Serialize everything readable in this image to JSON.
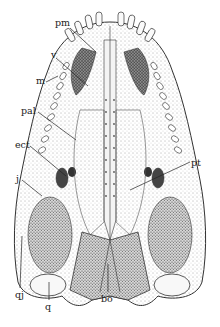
{
  "figure": {
    "background": "#ffffff",
    "ink": "#222222",
    "labels": [
      {
        "id": "pm",
        "text": "pm",
        "x": 55,
        "y": 18
      },
      {
        "id": "v",
        "text": "v",
        "x": 51,
        "y": 50
      },
      {
        "id": "m",
        "text": "m",
        "x": 36,
        "y": 76
      },
      {
        "id": "pal",
        "text": "pal",
        "x": 21,
        "y": 106
      },
      {
        "id": "ect",
        "text": "ect",
        "x": 15,
        "y": 140
      },
      {
        "id": "j",
        "text": "j",
        "x": 16,
        "y": 174
      },
      {
        "id": "pt",
        "text": "pt",
        "x": 191,
        "y": 158
      },
      {
        "id": "qj",
        "text": "qj",
        "x": 15,
        "y": 290
      },
      {
        "id": "q",
        "text": "q",
        "x": 45,
        "y": 302
      },
      {
        "id": "bo",
        "text": "bo",
        "x": 101,
        "y": 294
      }
    ]
  }
}
